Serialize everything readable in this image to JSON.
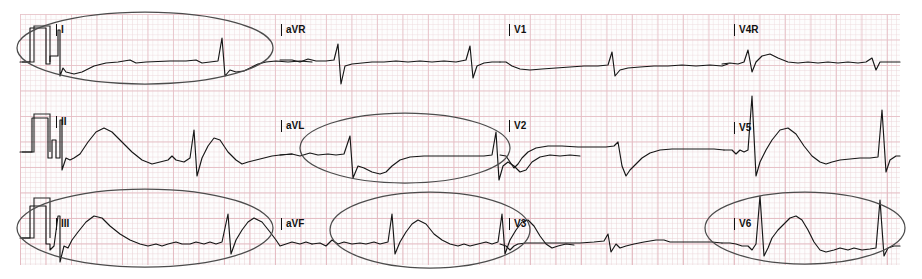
{
  "document": {
    "title": "12-lead ECG strip with highlighted leads",
    "width": 922,
    "height": 279,
    "paper": {
      "x": 20,
      "y": 14,
      "width": 880,
      "height": 251,
      "grid_small_mm": 1,
      "grid_large_mm": 5,
      "grid_minor_color": "#e8ced2",
      "grid_major_color": "#e0b0b8",
      "background_color": "#fdfdfd"
    },
    "trace_color": "#161616",
    "annotation_color": "#4c4c4c"
  },
  "layout": {
    "rows": 3,
    "columns": 4,
    "row_baselines": [
      62,
      152,
      238
    ],
    "column_starts": [
      20,
      280,
      500,
      725
    ]
  },
  "leads": [
    {
      "name": "I",
      "row": 0,
      "col": 0,
      "label": "I",
      "label_x": 56,
      "label_y": 24,
      "highlighted": true
    },
    {
      "name": "aVR",
      "row": 0,
      "col": 1,
      "label": "aVR",
      "label_x": 281,
      "label_y": 24,
      "highlighted": false
    },
    {
      "name": "V1",
      "row": 0,
      "col": 2,
      "label": "V1",
      "label_x": 509,
      "label_y": 24,
      "highlighted": false
    },
    {
      "name": "V4R",
      "row": 0,
      "col": 3,
      "label": "V4R",
      "label_x": 734,
      "label_y": 24,
      "highlighted": false
    },
    {
      "name": "II",
      "row": 1,
      "col": 0,
      "label": "II",
      "label_x": 56,
      "label_y": 116,
      "highlighted": false
    },
    {
      "name": "aVL",
      "row": 1,
      "col": 1,
      "label": "aVL",
      "label_x": 281,
      "label_y": 120,
      "highlighted": true
    },
    {
      "name": "V2",
      "row": 1,
      "col": 2,
      "label": "V2",
      "label_x": 509,
      "label_y": 120,
      "highlighted": false
    },
    {
      "name": "V5",
      "row": 1,
      "col": 3,
      "label": "V5",
      "label_x": 734,
      "label_y": 122,
      "highlighted": false
    },
    {
      "name": "III",
      "row": 2,
      "col": 0,
      "label": "III",
      "label_x": 56,
      "label_y": 218,
      "highlighted": true
    },
    {
      "name": "aVF",
      "row": 2,
      "col": 1,
      "label": "aVF",
      "label_x": 281,
      "label_y": 218,
      "highlighted": true
    },
    {
      "name": "V3",
      "row": 2,
      "col": 2,
      "label": "V3",
      "label_x": 509,
      "label_y": 218,
      "highlighted": false
    },
    {
      "name": "V6",
      "row": 2,
      "col": 3,
      "label": "V6",
      "label_x": 734,
      "label_y": 218,
      "highlighted": true
    }
  ],
  "calibration_pulses": [
    {
      "row": 0,
      "x": 34,
      "baseline_y": 62,
      "height_px": 36,
      "width_px": 16
    },
    {
      "row": 1,
      "x": 34,
      "baseline_y": 152,
      "height_px": 38,
      "width_px": 16
    },
    {
      "row": 2,
      "x": 34,
      "baseline_y": 238,
      "height_px": 40,
      "width_px": 16
    }
  ],
  "annotations": [
    {
      "id": "ellipse-lead-I",
      "shape": "ellipse",
      "cx": 145,
      "cy": 48,
      "rx": 128,
      "ry": 36,
      "targets": "I"
    },
    {
      "id": "ellipse-lead-aVL",
      "shape": "ellipse",
      "cx": 405,
      "cy": 148,
      "rx": 105,
      "ry": 35,
      "targets": "aVL"
    },
    {
      "id": "ellipse-lead-III",
      "shape": "ellipse",
      "cx": 145,
      "cy": 228,
      "rx": 128,
      "ry": 39,
      "targets": "III"
    },
    {
      "id": "ellipse-lead-aVF",
      "shape": "ellipse",
      "cx": 430,
      "cy": 230,
      "rx": 100,
      "ry": 38,
      "targets": "aVF"
    },
    {
      "id": "ellipse-lead-V6",
      "shape": "ellipse",
      "cx": 805,
      "cy": 228,
      "rx": 100,
      "ry": 36,
      "targets": "V6"
    }
  ],
  "chart_data": {
    "type": "line",
    "xlabel": "time",
    "ylabel": "amplitude (mV)",
    "grid": true,
    "legend": "none",
    "series": [
      {
        "name": "I",
        "points": "M20,62 L30,62 L30,28 L46,28 L46,64 L50,64 L50,56 L58,56 L58,30 L60,30 L60,76 L63,68 L66,72 L74,74 L82,72 L94,66 L106,63 L118,62 L130,60 L136,63 L146,62 L170,61 L186,61 L196,60 L202,63 L210,62 L218,61 L222,38 L225,76 L230,70 L236,72 L244,71 L252,67 L258,64 L266,62 L276,61 L288,62 L300,61 L312,62"
      },
      {
        "name": "aVR",
        "points": "M280,60 L292,60 L300,62 L308,59 L316,61 L326,61 L334,60 L338,44 L341,84 L345,66 L352,64 L362,63 L372,62 L384,62 L396,61 L408,62 L420,61 L432,62 L444,61 L456,62 L466,60 L470,46 L473,78 L477,66 L484,63 L492,62 L500,62"
      },
      {
        "name": "V1",
        "points": "M500,62 L506,62 L512,66 L520,69 L530,70 L542,69 L556,68 L570,67 L584,66 L598,66 L608,65 L612,52 L615,76 L620,70 L628,68 L640,67 L654,66 L668,66 L682,65 L696,66 L710,65 L722,66 L728,64"
      },
      {
        "name": "V4R",
        "points": "M722,64 L730,63 L738,64 L744,62 L748,50 L752,72 L756,62 L762,56 L770,54 L778,58 L788,62 L798,63 L808,62 L818,63 L828,62 L838,63 L848,62 L858,63 L866,62 L872,58 L876,70 L880,62 L890,62 L900,62"
      },
      {
        "name": "II",
        "points": "M20,152 L32,152 L32,118 L48,118 L48,158 L52,158 L52,140 L56,140 L56,158 L60,158 L60,120 L62,120 L62,170 L66,158 L70,160 L74,158 L80,154 L88,142 L96,132 L104,128 L112,132 L122,142 L132,152 L142,160 L152,164 L160,162 L168,160 L172,156 L176,160 L184,162 L190,158 L194,130 L197,176 L202,158 L208,146 L214,138 L220,140 L228,152 L236,160 L242,164 L248,162 L256,160 L264,158 L272,156 L280,155 L292,154"
      },
      {
        "name": "aVL",
        "points": "M280,155 L292,154 L300,156 L310,153 L318,155 L328,154 L336,155 L344,154 L350,136 L353,178 L358,166 L364,168 L372,172 L380,174 L386,172 L392,166 L400,160 L410,157 L424,156 L440,156 L456,156 L470,156 L484,156 L492,155 L496,132 L499,180 L503,166 L508,162 L514,166 L520,172 L526,170 L532,162 L540,157 L550,155 L560,156 L570,155 L580,156"
      },
      {
        "name": "V2",
        "points": "M500,155 L506,156 L510,162 L514,168 L518,164 L522,158 L528,152 L536,148 L548,146 L562,146 L578,147 L594,147 L606,147 L614,146 L618,142 L622,166 L626,176 L630,170 L636,164 L642,158 L650,153 L660,150 L672,149 L686,149 L700,149 L714,149 L724,150"
      },
      {
        "name": "V5",
        "points": "M724,150 L732,150 L736,154 L740,150 L744,152 L748,150 L752,96 L756,176 L760,162 L766,150 L772,140 L780,130 L788,128 L796,134 L804,146 L812,156 L820,162 L826,164 L832,162 L840,160 L850,159 L860,158 L870,158 L878,157 L882,110 L886,172 L890,160 L896,156 L900,156"
      },
      {
        "name": "III",
        "points": "M20,238 L30,238 L30,206 L46,206 L46,244 L50,244 L50,250 L54,246 L58,216 L60,216 L60,262 L64,246 L68,248 L72,240 L78,232 L86,222 L94,216 L102,218 L110,226 L120,234 L130,240 L140,244 L148,246 L156,244 L162,246 L168,244 L176,242 L182,244 L190,244 L196,242 L204,244 L210,242 L216,244 L222,242 L228,214 L231,254 L236,240 L242,230 L248,222 L254,218 L262,222 L270,232 L276,240 L280,246 L286,244 L292,242 L300,244 L306,242 L312,244"
      },
      {
        "name": "aVF",
        "points": "M312,244 L320,243 L326,246 L332,240 L338,244 L344,242 L352,244 L360,243 L366,244 L374,242 L380,244 L388,242 L392,214 L395,254 L400,242 L406,232 L412,224 L418,220 L426,224 L434,234 L442,240 L450,244 L458,246 L464,244 L470,246 L478,244 L486,242 L492,244 L498,242 L502,214 L505,254 L510,240 L516,230 L522,222 L528,220 L534,226 L540,236 L546,244 L552,248 L558,246 L566,244 L574,245"
      },
      {
        "name": "V3",
        "points": "M500,244 L506,246 L510,250 L514,246 L518,244 L526,243 L538,243 L552,243 L566,243 L580,243 L594,242 L604,241 L608,234 L611,252 L616,244 L620,248 L626,246 L634,244 L644,242 L656,240 L664,240 L670,242 L678,242 L688,242 L700,242 L712,242 L722,243"
      },
      {
        "name": "V6",
        "points": "M722,243 L730,243 L736,244 L742,246 L748,246 L752,250 L756,244 L760,196 L764,256 L768,248 L772,238 L778,230 L784,224 L790,218 L796,216 L802,220 L808,230 L814,242 L820,250 L826,252 L834,250 L840,248 L848,250 L854,248 L862,250 L870,249 L876,248 L880,200 L884,256 L888,248 L894,246 L900,246"
      }
    ]
  }
}
